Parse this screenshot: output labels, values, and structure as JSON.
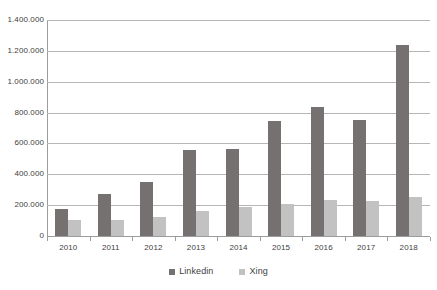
{
  "chart_data": {
    "type": "bar",
    "title": "",
    "subtitle": "",
    "xlabel": "",
    "ylabel": "",
    "categories": [
      "2010",
      "2011",
      "2012",
      "2013",
      "2014",
      "2015",
      "2016",
      "2017",
      "2018"
    ],
    "series": [
      {
        "name": "Linkedin",
        "color": "#767171",
        "values": [
          175000,
          270000,
          350000,
          555000,
          565000,
          745000,
          835000,
          755000,
          1235000
        ]
      },
      {
        "name": "Xing",
        "color": "#c2c2c2",
        "values": [
          105000,
          105000,
          125000,
          165000,
          185000,
          210000,
          235000,
          230000,
          250000
        ]
      }
    ],
    "ylim": [
      0,
      1400000
    ],
    "y_ticks": [
      0,
      200000,
      400000,
      600000,
      800000,
      1000000,
      1200000,
      1400000
    ],
    "y_tick_labels": [
      "0",
      "200.000",
      "400.000",
      "600.000",
      "800.000",
      "1.000.000",
      "1.200.000",
      "1.400.000"
    ],
    "grid": true,
    "grid_axis": "y",
    "legend_position": "bottom",
    "legend_entries": [
      "Linkedin",
      "Xing"
    ]
  }
}
